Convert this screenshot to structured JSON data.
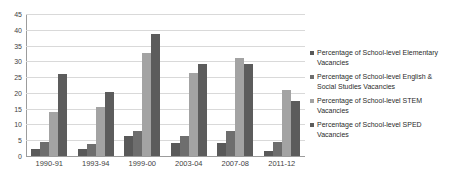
{
  "chart_data": {
    "type": "bar",
    "title": "",
    "subtitle": "",
    "xlabel": "",
    "ylabel": "",
    "ylim": [
      0,
      45
    ],
    "y_ticks": [
      0,
      5,
      10,
      15,
      20,
      25,
      30,
      35,
      40,
      45
    ],
    "grid": true,
    "legend_position": "right",
    "categories": [
      "1990-91",
      "1993-94",
      "1999-00",
      "2003-04",
      "2007-08",
      "2011-12"
    ],
    "series": [
      {
        "name": "Percentage of School-level Elementary Vacancies",
        "color": "#595959",
        "values": [
          2.2,
          2.2,
          6.2,
          4.1,
          4.2,
          1.5
        ]
      },
      {
        "name": "Percentage of School-level English & Social Studies Vacancies",
        "color": "#6e6e6e",
        "values": [
          4.6,
          3.8,
          8.0,
          6.3,
          7.9,
          4.5
        ]
      },
      {
        "name": "Percentage of School-level STEM Vacancies",
        "color": "#a3a3a3",
        "values": [
          13.8,
          15.4,
          32.5,
          26.3,
          31.0,
          20.8
        ]
      },
      {
        "name": "Percentage of School-level SPED Vacancies",
        "color": "#5c5c5c",
        "values": [
          26.0,
          20.2,
          38.8,
          29.3,
          29.3,
          17.3
        ]
      }
    ]
  },
  "axis": {
    "gridline_color": "#d9d9d9",
    "axis_line_color": "#9c9c9c"
  }
}
